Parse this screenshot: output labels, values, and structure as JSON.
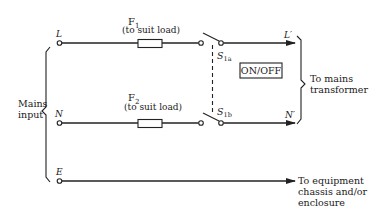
{
  "diagram": {
    "type": "mains-input-circuit",
    "terminals": {
      "live": "L",
      "neutral": "N",
      "earth": "E",
      "live_out": "L′",
      "neutral_out": "N′"
    },
    "fuses": [
      {
        "name": "F",
        "subscript": "1",
        "note": "(to suit load)"
      },
      {
        "name": "F",
        "subscript": "2",
        "note": "(to suit load)"
      }
    ],
    "switch": {
      "poles": [
        {
          "name": "S",
          "subscript": "1a"
        },
        {
          "name": "S",
          "subscript": "1b"
        }
      ],
      "label": "ON/OFF"
    },
    "input_label": [
      "Mains",
      "input"
    ],
    "output_transformer_label": [
      "To mains",
      "transformer"
    ],
    "output_chassis_label": [
      "To equipment",
      "chassis and/or",
      "enclosure"
    ]
  }
}
